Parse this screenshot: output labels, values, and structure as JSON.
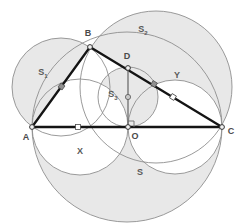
{
  "figure": {
    "background": "#ffffff",
    "shade_fill": "#e6e6e6",
    "shade_stroke": "#8c8c8c",
    "line_color": "#1a1a1a",
    "label_color": "#4a4a4a",
    "width": 240,
    "height": 224
  },
  "points": [
    {
      "name": "A",
      "label": "A",
      "x": 32,
      "y": 127,
      "label_x": 26,
      "label_y": 137,
      "marker": "vertex"
    },
    {
      "name": "B",
      "label": "B",
      "x": 90,
      "y": 47,
      "label_x": 88,
      "label_y": 34,
      "marker": "vertex"
    },
    {
      "name": "C",
      "label": "C",
      "x": 222,
      "y": 127,
      "label_x": 230,
      "label_y": 132,
      "marker": "vertex"
    },
    {
      "name": "D",
      "label": "D",
      "x": 128,
      "y": 68,
      "label_x": 126,
      "label_y": 57,
      "marker": "vertex"
    },
    {
      "name": "O",
      "label": "O",
      "x": 128,
      "y": 127,
      "label_x": 134,
      "label_y": 136,
      "marker": "vertex"
    }
  ],
  "midpoint_markers": [
    {
      "name": "midpoint-AB",
      "x": 62,
      "y": 87,
      "style": "filled"
    },
    {
      "name": "midpoint-AO",
      "x": 78,
      "y": 127,
      "style": "hollow"
    },
    {
      "name": "midpoint-DC",
      "x": 154,
      "y": 84,
      "style": "filled"
    },
    {
      "name": "midpoint-DC-2",
      "x": 173,
      "y": 97,
      "style": "hollow"
    },
    {
      "name": "center-S3",
      "x": 128,
      "y": 97,
      "style": "hollow"
    }
  ],
  "circles": [
    {
      "name": "circle-S",
      "label": "S",
      "cx": 127,
      "cy": 127,
      "r": 95,
      "shaded": true
    },
    {
      "name": "circle-S1",
      "label": "S₁",
      "cx": 61,
      "cy": 87,
      "r": 49,
      "shaded": true
    },
    {
      "name": "circle-S2",
      "label": "S₂",
      "cx": 156,
      "cy": 87,
      "r": 76,
      "shaded": true
    },
    {
      "name": "circle-S3",
      "label": "S₃",
      "cx": 128,
      "cy": 97,
      "r": 30,
      "shaded": true
    },
    {
      "name": "circle-X",
      "label": "X",
      "cx": 80,
      "cy": 127,
      "r": 48,
      "shaded": false
    },
    {
      "name": "circle-Y",
      "label": "Y",
      "cx": 175,
      "cy": 127,
      "r": 47,
      "shaded": false
    }
  ],
  "region_labels": [
    {
      "name": "region-label-S1",
      "text": "S",
      "sub": "1",
      "x": 43,
      "y": 73
    },
    {
      "name": "region-label-S2",
      "text": "S",
      "sub": "2",
      "x": 143,
      "y": 30
    },
    {
      "name": "region-label-S3",
      "text": "S",
      "sub": "3",
      "x": 113,
      "y": 95
    },
    {
      "name": "region-label-S",
      "text": "S",
      "sub": "",
      "x": 140,
      "y": 173
    },
    {
      "name": "region-label-X",
      "text": "X",
      "sub": "",
      "x": 80,
      "y": 152
    },
    {
      "name": "region-label-Y",
      "text": "Y",
      "sub": "",
      "x": 177,
      "y": 76
    }
  ],
  "segments": [
    {
      "name": "segment-AB",
      "from": "A",
      "to": "B"
    },
    {
      "name": "segment-BC",
      "from": "B",
      "to": "C"
    },
    {
      "name": "segment-AC",
      "from": "A",
      "to": "C"
    },
    {
      "name": "segment-DO",
      "from": "D",
      "to": "O"
    }
  ],
  "right_angle": {
    "name": "right-angle-at-O",
    "x": 128,
    "y": 127,
    "size": 6
  }
}
